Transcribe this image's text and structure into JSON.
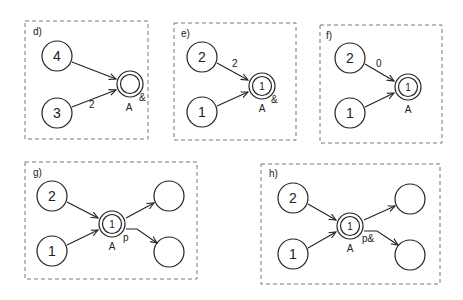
{
  "panels": {
    "d": {
      "label": "d)",
      "nodes": {
        "top": "4",
        "bottom": "3",
        "target_inner": ""
      },
      "target_name": "A",
      "target_marker": "&",
      "edge_labels": {
        "top": "",
        "bottom": "2"
      }
    },
    "e": {
      "label": "e)",
      "nodes": {
        "top": "2",
        "bottom": "1",
        "target_inner": "1"
      },
      "target_name": "A",
      "target_marker": "&",
      "edge_labels": {
        "top": "2",
        "bottom": ""
      }
    },
    "f": {
      "label": "f)",
      "nodes": {
        "top": "2",
        "bottom": "1",
        "target_inner": "1"
      },
      "target_name": "A",
      "target_marker": "",
      "edge_labels": {
        "top": "0",
        "bottom": ""
      }
    },
    "g": {
      "label": "g)",
      "nodes": {
        "top": "2",
        "bottom": "1",
        "target_inner": "1",
        "out_top": "",
        "out_bottom": ""
      },
      "target_name": "A",
      "target_marker": "p"
    },
    "h": {
      "label": "h)",
      "nodes": {
        "top": "2",
        "bottom": "1",
        "target_inner": "1",
        "out_top": "",
        "out_bottom": ""
      },
      "target_name": "A",
      "target_marker": "p&"
    }
  }
}
